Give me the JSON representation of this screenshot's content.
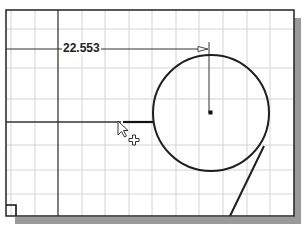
{
  "drawing": {
    "dimension": {
      "value": "22.553",
      "label_pos": [
        62,
        41
      ]
    },
    "grid": {
      "color": "#d4d4d4",
      "vertical_x": [
        11,
        35,
        82,
        105,
        129,
        152,
        176,
        199,
        223,
        247,
        270
      ],
      "horizontal_y": [
        29,
        68,
        99,
        145,
        170,
        194
      ]
    },
    "frame": {
      "x": 6,
      "y": 10,
      "width": 288,
      "height": 206,
      "stroke": "#222222"
    },
    "axis_lines": {
      "vertical_x": 58,
      "dimension_y": 49,
      "sketch_line_y": 122
    },
    "circle": {
      "cx": 211,
      "cy": 113,
      "r": 58
    },
    "tangent_line": {
      "x1": 264,
      "y1": 146,
      "x2": 230,
      "y2": 216
    },
    "cursor": {
      "type": "arrow-with-crosshair",
      "x": 118,
      "y": 121
    },
    "origin_marker": {
      "x": 6,
      "y": 205,
      "size": 10
    }
  }
}
